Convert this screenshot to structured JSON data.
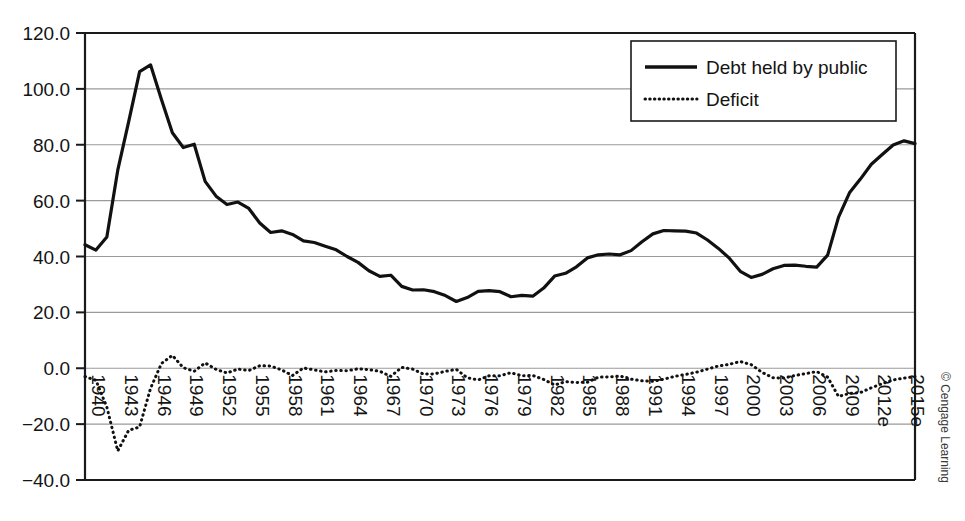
{
  "chart_data": {
    "type": "line",
    "title": "",
    "subtitle": "",
    "xlabel": "",
    "ylabel": "",
    "ylim": [
      -40.0,
      120.0
    ],
    "yticks": [
      -40.0,
      -20.0,
      0.0,
      20.0,
      40.0,
      60.0,
      80.0,
      100.0,
      120.0
    ],
    "ytick_labels": [
      "-40.0",
      "-20.0",
      "0.0",
      "20.0",
      "40.0",
      "60.0",
      "80.0",
      "100.0",
      "120.0"
    ],
    "grid": true,
    "grid_axis": "y",
    "legend_position": "top-right",
    "x": [
      1940,
      1941,
      1942,
      1943,
      1944,
      1945,
      1946,
      1947,
      1948,
      1949,
      1950,
      1951,
      1952,
      1953,
      1954,
      1955,
      1956,
      1957,
      1958,
      1959,
      1960,
      1961,
      1962,
      1963,
      1964,
      1965,
      1966,
      1967,
      1968,
      1969,
      1970,
      1971,
      1972,
      1973,
      1974,
      1975,
      1976,
      1977,
      1978,
      1979,
      1980,
      1981,
      1982,
      1983,
      1984,
      1985,
      1986,
      1987,
      1988,
      1989,
      1990,
      1991,
      1992,
      1993,
      1994,
      1995,
      1996,
      1997,
      1998,
      1999,
      2000,
      2001,
      2002,
      2003,
      2004,
      2005,
      2006,
      2007,
      2008,
      2009,
      2010,
      2011,
      2012,
      2013,
      2014,
      2015,
      2016
    ],
    "xtick_values": [
      1940,
      1943,
      1946,
      1949,
      1952,
      1955,
      1958,
      1961,
      1964,
      1967,
      1970,
      1973,
      1976,
      1979,
      1982,
      1985,
      1988,
      1991,
      1994,
      1997,
      2000,
      2003,
      2006,
      2009,
      2012,
      2015
    ],
    "xtick_labels": [
      "1940",
      "1943",
      "1946",
      "1949",
      "1952",
      "1955",
      "1958",
      "1961",
      "1964",
      "1967",
      "1970",
      "1973",
      "1976",
      "1979",
      "1982",
      "1985",
      "1988",
      "1991",
      "1994",
      "1997",
      "2000",
      "2003",
      "2006",
      "2009",
      "2012e",
      "2015e"
    ],
    "xtick_rotation": 90,
    "series": [
      {
        "name": "Debt held by public",
        "style": "solid",
        "color": "#111111",
        "values": [
          44.2,
          42.3,
          47.0,
          70.9,
          88.3,
          106.2,
          108.6,
          96.2,
          84.3,
          79.0,
          80.2,
          66.9,
          61.6,
          58.6,
          59.5,
          57.2,
          52.0,
          48.6,
          49.2,
          47.9,
          45.6,
          45.0,
          43.7,
          42.4,
          40.0,
          37.9,
          34.9,
          32.9,
          33.3,
          29.3,
          28.0,
          28.1,
          27.4,
          26.0,
          23.9,
          25.3,
          27.5,
          27.8,
          27.4,
          25.6,
          26.1,
          25.8,
          28.7,
          33.0,
          34.0,
          36.3,
          39.5,
          40.6,
          40.9,
          40.6,
          42.1,
          45.3,
          48.1,
          49.3,
          49.2,
          49.1,
          48.4,
          45.9,
          42.9,
          39.4,
          34.7,
          32.5,
          33.6,
          35.6,
          36.8,
          36.9,
          36.5,
          36.2,
          40.5,
          54.1,
          62.8,
          67.7,
          73.0,
          76.5,
          79.9,
          81.4,
          80.4
        ]
      },
      {
        "name": "Deficit",
        "style": "dotted",
        "color": "#111111",
        "values": [
          -3.0,
          -4.3,
          -13.9,
          -29.6,
          -22.2,
          -21.0,
          -7.2,
          1.7,
          4.6,
          0.2,
          -1.1,
          1.9,
          -0.4,
          -1.7,
          -0.3,
          -0.8,
          0.9,
          0.8,
          -0.6,
          -2.6,
          0.1,
          -0.6,
          -1.3,
          -0.8,
          -0.9,
          -0.2,
          -0.5,
          -1.1,
          -2.9,
          0.3,
          -0.3,
          -2.1,
          -2.0,
          -1.1,
          -0.4,
          -3.4,
          -4.2,
          -2.7,
          -2.7,
          -1.6,
          -2.7,
          -2.6,
          -4.0,
          -6.0,
          -4.8,
          -5.1,
          -5.0,
          -3.2,
          -3.1,
          -2.8,
          -3.9,
          -4.5,
          -4.7,
          -3.9,
          -2.9,
          -2.2,
          -1.4,
          -0.3,
          0.8,
          1.4,
          2.4,
          1.3,
          -1.5,
          -3.4,
          -3.5,
          -2.6,
          -1.9,
          -1.2,
          -3.2,
          -10.1,
          -9.0,
          -8.7,
          -7.0,
          -5.5,
          -4.2,
          -3.5,
          -3.0
        ]
      }
    ],
    "annotations": [
      {
        "name": "copyright",
        "text": "© Cengage Learning",
        "position": "right-edge",
        "rotation": 90
      }
    ]
  },
  "legend": {
    "items": [
      {
        "label": "Debt held by public",
        "style": "solid"
      },
      {
        "label": "Deficit",
        "style": "dotted"
      }
    ]
  },
  "credit": {
    "text": "© Cengage Learning"
  }
}
